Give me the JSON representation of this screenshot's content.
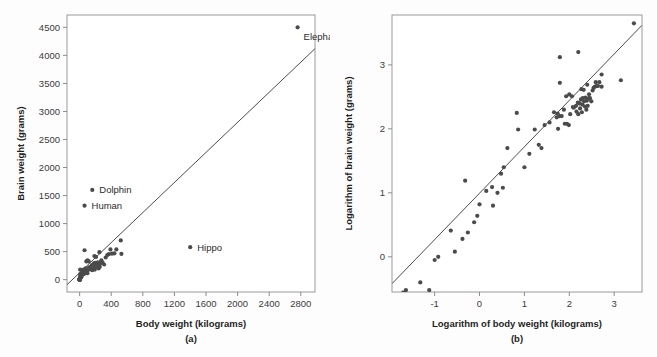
{
  "figure": {
    "background": "#fdfdfd",
    "point_color": "#4b4b4b",
    "line_color": "#4d4d4d",
    "frame_color": "#9a9a9a"
  },
  "chart_data": [
    {
      "type": "scatter",
      "panel_tag": "(a)",
      "title": "",
      "xlabel": "Body  weight (kilograms)",
      "ylabel": "Brain weight (grams)",
      "xlim": [
        -160,
        2980
      ],
      "ylim": [
        -220,
        4720
      ],
      "xticks": [
        0,
        400,
        800,
        1200,
        1600,
        2000,
        2400,
        2800
      ],
      "xticklabels": [
        "0",
        "400",
        "800",
        "1200",
        "1600",
        "2000",
        "2400",
        "2800"
      ],
      "yticks": [
        0,
        500,
        1000,
        1500,
        2000,
        2500,
        3000,
        3500,
        4000,
        4500
      ],
      "yticklabels": [
        "0",
        "500",
        "1000",
        "1500",
        "2000",
        "2500",
        "3000",
        "3500",
        "4000",
        "4500"
      ],
      "grid": false,
      "legend": "none",
      "regression_line": {
        "x": [
          -160,
          2980
        ],
        "y": [
          -90,
          4120
        ]
      },
      "annotations": [
        {
          "label": "Elephant",
          "x": 2760,
          "y": 4500,
          "dx": 6,
          "dy": 13
        },
        {
          "label": "Dolphin",
          "x": 160,
          "y": 1600,
          "dx": 7,
          "dy": 3.5
        },
        {
          "label": "Human",
          "x": 62,
          "y": 1320,
          "dx": 7,
          "dy": 3.5
        },
        {
          "label": "Hippo",
          "x": 1400,
          "y": 580,
          "dx": 7,
          "dy": 3.5
        }
      ],
      "x": [
        2760,
        160,
        62,
        1400,
        521,
        465,
        529,
        187,
        207,
        250,
        192,
        160,
        98,
        115,
        85,
        80,
        56,
        55,
        60,
        36,
        28,
        24,
        21,
        17,
        13,
        10,
        7.2,
        6.8,
        4.2,
        3.5,
        3.3,
        3.0,
        2.5,
        2.0,
        1.9,
        1.4,
        1.0,
        0.9,
        0.75,
        0.55,
        0.48,
        0.42,
        0.28,
        0.23,
        0.12,
        0.1,
        0.075,
        0.048,
        0.023,
        0.014,
        0.01,
        62,
        100,
        120,
        140,
        155,
        170,
        180,
        200,
        215,
        230,
        240,
        255,
        265,
        275,
        290,
        310,
        330,
        350,
        370,
        390,
        410,
        440,
        46,
        52,
        68,
        75,
        90,
        105,
        125,
        145,
        165,
        175,
        195,
        225,
        245,
        275
      ],
      "y": [
        4500,
        1600,
        1320,
        580,
        700,
        540,
        460,
        420,
        406,
        490,
        180,
        169,
        115,
        325,
        325,
        119,
        100,
        175,
        157,
        125,
        115,
        50,
        56,
        98,
        41,
        25,
        98,
        179,
        50,
        25,
        12,
        20,
        10,
        6.3,
        12.3,
        10.8,
        6.6,
        4.4,
        3.5,
        2.4,
        15.5,
        1.9,
        1.2,
        2.6,
        1.0,
        0.9,
        0.3,
        0.4,
        0.3,
        0.14,
        0.25,
        525,
        345,
        220,
        230,
        260,
        250,
        290,
        300,
        270,
        310,
        200,
        230,
        295,
        345,
        305,
        270,
        395,
        440,
        455,
        540,
        465,
        470,
        180,
        150,
        160,
        200,
        120,
        170,
        215,
        185,
        250,
        210,
        240,
        225,
        275,
        300
      ]
    },
    {
      "type": "scatter",
      "panel_tag": "(b)",
      "title": "",
      "xlabel": "Logarithm of body weight (kilograms)",
      "ylabel": "Logarithm of brain weight (grams)",
      "xlim": [
        -1.95,
        3.62
      ],
      "ylim": [
        -0.55,
        3.78
      ],
      "xticks": [
        -1,
        0,
        1,
        2,
        3
      ],
      "xticklabels": [
        "-1",
        "0",
        "1",
        "2",
        "3"
      ],
      "yticks": [
        0,
        1,
        2,
        3
      ],
      "yticklabels": [
        "0",
        "1",
        "2",
        "3"
      ],
      "grid": false,
      "legend": "none",
      "regression_line": {
        "x": [
          -1.95,
          3.62
        ],
        "y": [
          -0.42,
          3.62
        ]
      },
      "annotations": [],
      "x": [
        3.44,
        2.2,
        1.79,
        3.15,
        2.72,
        2.67,
        2.72,
        2.27,
        2.32,
        2.4,
        2.28,
        2.2,
        1.99,
        2.06,
        1.93,
        1.9,
        1.75,
        1.74,
        1.78,
        1.56,
        1.45,
        1.38,
        1.32,
        1.23,
        1.11,
        1.0,
        0.86,
        0.83,
        0.62,
        0.54,
        0.52,
        0.48,
        0.4,
        0.3,
        0.28,
        0.15,
        0.0,
        -0.05,
        -0.12,
        -0.26,
        -0.32,
        -0.38,
        -0.55,
        -0.64,
        -0.92,
        -1.0,
        -1.12,
        -1.32,
        -1.64,
        -1.85,
        -1.7,
        1.79,
        2.0,
        2.08,
        2.15,
        2.19,
        2.23,
        2.26,
        2.3,
        2.33,
        2.36,
        2.38,
        2.41,
        2.42,
        2.44,
        2.46,
        2.49,
        2.52,
        2.54,
        2.57,
        2.59,
        2.61,
        2.64,
        1.66,
        1.72,
        1.83,
        1.88,
        1.95,
        2.02,
        2.1,
        2.16,
        2.22,
        2.24,
        2.29,
        2.35,
        2.39,
        2.44
      ],
      "y": [
        3.65,
        3.2,
        3.12,
        2.76,
        2.85,
        2.73,
        2.66,
        2.62,
        2.61,
        2.69,
        2.26,
        2.23,
        2.06,
        2.51,
        2.51,
        2.08,
        2.0,
        2.24,
        2.2,
        2.1,
        2.06,
        1.7,
        1.75,
        1.99,
        1.61,
        1.4,
        1.99,
        2.25,
        1.7,
        1.4,
        1.08,
        1.3,
        1.0,
        0.8,
        1.09,
        1.03,
        0.82,
        0.64,
        0.54,
        0.38,
        1.19,
        0.28,
        0.08,
        0.41,
        0.0,
        -0.05,
        -0.52,
        -0.4,
        -0.52,
        -0.85,
        -0.56,
        2.72,
        2.54,
        2.34,
        2.36,
        2.41,
        2.4,
        2.46,
        2.48,
        2.43,
        2.49,
        2.3,
        2.36,
        2.47,
        2.54,
        2.48,
        2.43,
        2.6,
        2.64,
        2.66,
        2.73,
        2.67,
        2.67,
        2.26,
        2.18,
        2.2,
        2.3,
        2.08,
        2.23,
        2.33,
        2.27,
        2.4,
        2.32,
        2.38,
        2.35,
        2.44,
        2.48
      ]
    }
  ]
}
